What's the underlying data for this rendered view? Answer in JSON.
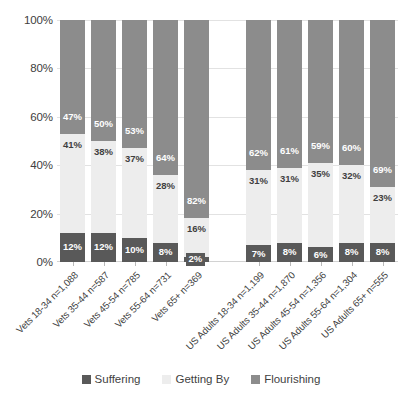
{
  "chart_data": {
    "type": "bar",
    "subtype": "100% stacked column",
    "title": "",
    "subtitle": "",
    "xlabel": "",
    "ylabel": "",
    "ylim": [
      0,
      100
    ],
    "yticks": [
      "0%",
      "20%",
      "40%",
      "60%",
      "80%",
      "100%"
    ],
    "ytick_values": [
      0,
      20,
      40,
      60,
      80,
      100
    ],
    "grid": true,
    "legend_position": "bottom",
    "categories": [
      "Vets 18-34 n=1,088",
      "Vets 35-44 n=587",
      "Vets 45-54 n=785",
      "Vets 55-64 n=731",
      "Vets 65+ n=369",
      "US Adults 18-34 n=1,199",
      "US Adults 35-44 n=1,870",
      "US Adults 45-54 n=1,356",
      "US Adults 55-64 n=1,304",
      "US Adults 65+ n=555"
    ],
    "group_break_after_index": 4,
    "series": [
      {
        "name": "Suffering",
        "color": "#595959",
        "values": [
          12,
          12,
          10,
          8,
          2,
          7,
          8,
          6,
          8,
          8
        ],
        "data_labels": [
          "12%",
          "12%",
          "10%",
          "8%",
          "2%",
          "7%",
          "8%",
          "6%",
          "8%",
          "8%"
        ]
      },
      {
        "name": "Getting By",
        "color": "#ededed",
        "values": [
          41,
          38,
          37,
          28,
          16,
          31,
          31,
          35,
          32,
          23
        ],
        "data_labels": [
          "41%",
          "38%",
          "37%",
          "28%",
          "16%",
          "31%",
          "31%",
          "35%",
          "32%",
          "23%"
        ]
      },
      {
        "name": "Flourishing",
        "color": "#8c8c8c",
        "values": [
          47,
          50,
          53,
          64,
          82,
          62,
          61,
          59,
          60,
          69
        ],
        "data_labels": [
          "47%",
          "50%",
          "53%",
          "64%",
          "82%",
          "62%",
          "61%",
          "59%",
          "60%",
          "69%"
        ]
      }
    ]
  },
  "legend": {
    "items": [
      {
        "label": "Suffering",
        "color": "#595959"
      },
      {
        "label": "Getting By",
        "color": "#ededed"
      },
      {
        "label": "Flourishing",
        "color": "#8c8c8c"
      }
    ]
  },
  "axis": {
    "y": {
      "t0": "0%",
      "t1": "20%",
      "t2": "40%",
      "t3": "60%",
      "t4": "80%",
      "t5": "100%"
    }
  }
}
